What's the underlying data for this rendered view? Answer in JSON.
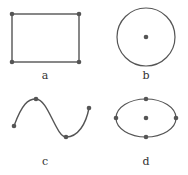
{
  "colors": {
    "stroke": "#555555",
    "point": "#555555",
    "label": "#333333",
    "background": "#ffffff"
  },
  "panels": [
    {
      "id": "a",
      "label": "a",
      "shape": "rectangle",
      "rect": {
        "x": 12,
        "y": 14,
        "width": 67,
        "height": 48
      },
      "points": [
        [
          12,
          14
        ],
        [
          79,
          14
        ],
        [
          12,
          62
        ],
        [
          79,
          62
        ]
      ],
      "label_pos": [
        45,
        79
      ]
    },
    {
      "id": "b",
      "label": "b",
      "shape": "circle",
      "circle": {
        "cx": 146,
        "cy": 37,
        "r": 29
      },
      "points": [
        [
          146,
          37
        ]
      ],
      "label_pos": [
        146,
        79
      ]
    },
    {
      "id": "c",
      "label": "c",
      "shape": "curve",
      "path": "M14,126 C22,104 28,99 36,99 C48,99 56,137 66,137 C78,137 86,124 89,108",
      "points": [
        [
          14,
          126
        ],
        [
          36,
          99
        ],
        [
          66,
          137
        ],
        [
          89,
          108
        ]
      ],
      "label_pos": [
        45,
        165
      ]
    },
    {
      "id": "d",
      "label": "d",
      "shape": "ellipse",
      "ellipse": {
        "cx": 146,
        "cy": 118,
        "rx": 30,
        "ry": 19
      },
      "points": [
        [
          116,
          118
        ],
        [
          176,
          118
        ],
        [
          146,
          99
        ],
        [
          146,
          137
        ],
        [
          146,
          118
        ]
      ],
      "label_pos": [
        146,
        165
      ]
    }
  ]
}
